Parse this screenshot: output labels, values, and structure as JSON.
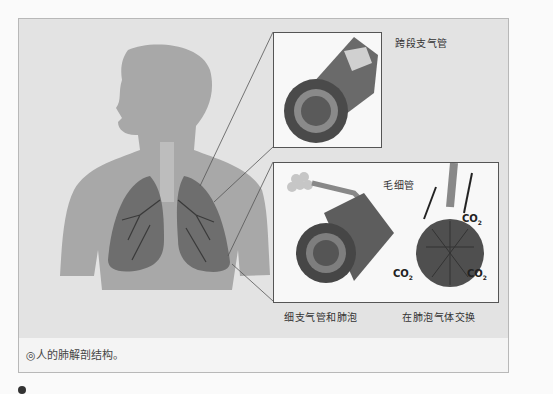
{
  "figure": {
    "caption_marker": "◎",
    "caption": "人的肺解剖结构。",
    "insets": {
      "top": {
        "label": "跨段支气管"
      },
      "bottom": {
        "left_label": "细支气管和肺泡",
        "right_label": "在肺泡气体交换",
        "capillary_label": "毛细管",
        "gas_labels": [
          "CO2",
          "CO2",
          "CO2",
          "O2",
          "O2",
          "O2"
        ]
      }
    }
  },
  "colors": {
    "background": "#fafafa",
    "figure_bg": "#e3e3e3",
    "silhouette": "#a8a8a8",
    "lung": "#6e6e6e",
    "inset_border": "#555555"
  }
}
